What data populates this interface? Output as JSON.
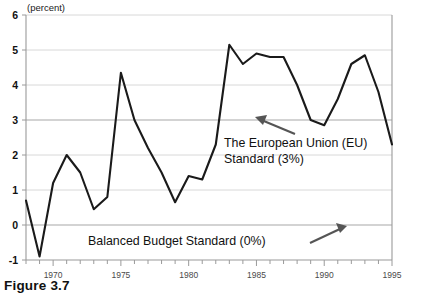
{
  "figure": {
    "caption": "Figure 3.7",
    "unit_label": "(percent)"
  },
  "annotations": {
    "eu_line1": "The European Union (EU)",
    "eu_line2": "Standard (3%)",
    "balanced_budget": "Balanced Budget Standard (0%)"
  },
  "colors": {
    "line": "#1a1a1a",
    "grid": "#d8d8d8",
    "axis": "#9a9a9a",
    "text": "#111111",
    "arrow": "#555555",
    "background": "#ffffff"
  },
  "chart_data": {
    "type": "line",
    "title": "",
    "subtitle": "",
    "xlabel": "",
    "ylabel": "(percent)",
    "xlim": [
      1968,
      1995
    ],
    "ylim": [
      -1,
      6
    ],
    "yticks": [
      -1,
      0,
      1,
      2,
      3,
      4,
      5,
      6
    ],
    "ytick_labels": [
      "-1",
      "0",
      "1",
      "2",
      "3",
      "4",
      "5",
      "6"
    ],
    "xticks": [
      1970,
      1975,
      1980,
      1985,
      1990,
      1995
    ],
    "xtick_labels": [
      "1970",
      "1975",
      "1980",
      "1985",
      "1990",
      "1995"
    ],
    "xtick_minor_step": 1,
    "grid": true,
    "grid_axis": "y",
    "legend": false,
    "reference_lines": [
      {
        "value": 3,
        "label": "The European Union (EU) Standard (3%)"
      },
      {
        "value": 0,
        "label": "Balanced Budget Standard (0%)"
      }
    ],
    "series": [
      {
        "name": "Deficit (percent of GDP)",
        "x": [
          1968,
          1969,
          1970,
          1971,
          1972,
          1973,
          1974,
          1975,
          1976,
          1977,
          1978,
          1979,
          1980,
          1981,
          1982,
          1983,
          1984,
          1985,
          1986,
          1987,
          1988,
          1989,
          1990,
          1991,
          1992,
          1993,
          1994,
          1995
        ],
        "values": [
          0.7,
          -0.9,
          1.2,
          2.0,
          1.5,
          0.45,
          0.8,
          4.35,
          3.0,
          2.2,
          1.5,
          0.65,
          1.4,
          1.3,
          2.3,
          5.15,
          4.6,
          4.9,
          4.8,
          4.8,
          4.0,
          3.0,
          2.85,
          3.6,
          4.6,
          4.85,
          3.8,
          2.3
        ]
      }
    ]
  }
}
